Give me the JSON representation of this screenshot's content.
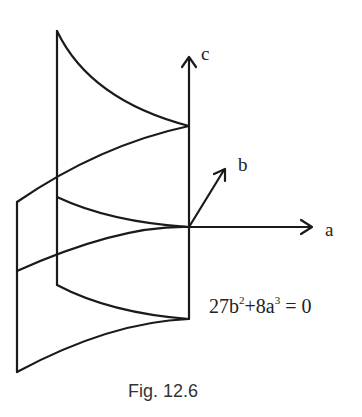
{
  "figure": {
    "caption": "Fig. 12.6",
    "equation": {
      "prefix": "27b",
      "exp1": "2",
      "middle": "+8a",
      "exp2": "3",
      "suffix": " = 0"
    },
    "axes": {
      "a": "a",
      "b": "b",
      "c": "c"
    }
  },
  "colors": {
    "line": "#1a1a1a",
    "background": "#ffffff"
  }
}
